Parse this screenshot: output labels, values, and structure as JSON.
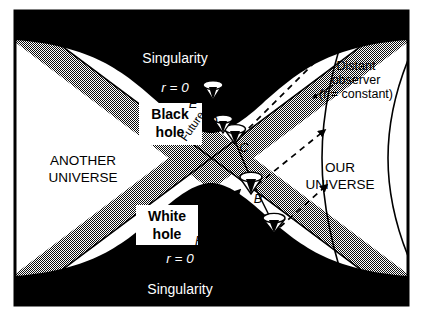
{
  "figure": {
    "type": "kruskal-szekeres-spacetime-diagram",
    "background": "#ffffff",
    "ink": "#000000",
    "shade": "#b4b4b4"
  },
  "regions": {
    "upper_singularity": {
      "name_label": "Singularity",
      "radius_label": "r = 0"
    },
    "lower_singularity": {
      "name_label": "Singularity",
      "radius_label": "r = 0"
    },
    "black_hole": {
      "line1": "Black",
      "line2": "hole"
    },
    "white_hole": {
      "line1": "White",
      "line2": "hole"
    },
    "another_universe": {
      "line1": "ANOTHER",
      "line2": "UNIVERSE"
    },
    "our_universe": {
      "line1": "OUR",
      "line2": "UNIVERSE"
    }
  },
  "horizons": {
    "future": {
      "text": "horizon r = 2M, t = +∞",
      "direction_label": "Future"
    },
    "past": {
      "text": "Past horizon r = 2M, t = −∞"
    }
  },
  "observer": {
    "line1": "Distant",
    "line2": "observer",
    "line3": "(r = constant)"
  },
  "light_cones": [
    {
      "id": "A",
      "label": "A",
      "x": 274,
      "y": 223,
      "tilt": 0
    },
    {
      "id": "B",
      "label": "B",
      "x": 251,
      "y": 182,
      "tilt": 0
    },
    {
      "id": "C",
      "label": "C",
      "x": 235,
      "y": 133,
      "tilt": 0
    },
    {
      "id": "D",
      "label": "D",
      "x": 213,
      "y": 113,
      "tilt": 0
    },
    {
      "id": "E",
      "label": "E",
      "x": 213,
      "y": 93,
      "tilt": 0
    },
    {
      "id": "F",
      "label": "F",
      "x": 185,
      "y": 223,
      "tilt": -22
    }
  ],
  "light_rays": [
    {
      "from_cone": "A",
      "to": "observer-worldline"
    },
    {
      "from_cone": "B",
      "to": "observer-worldline"
    },
    {
      "from_cone": "C",
      "to": "observer-worldline"
    },
    {
      "from_cone": "D",
      "to": "upper-right"
    },
    {
      "from_cone": "F",
      "to": "upper-right"
    }
  ],
  "r_constant_curves": 2
}
